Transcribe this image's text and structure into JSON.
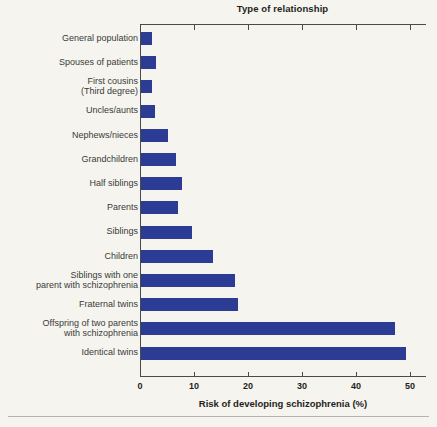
{
  "chart_data": {
    "type": "bar",
    "orientation": "horizontal",
    "title": "Type of relationship",
    "xlabel": "Risk of developing schizophrenia (%)",
    "ylabel": "",
    "xlim": [
      0,
      50
    ],
    "xticks": [
      0,
      10,
      20,
      30,
      40,
      50
    ],
    "xtick_labels": [
      "0",
      "10",
      "20",
      "30",
      "40",
      "50"
    ],
    "grid": false,
    "legend": null,
    "bar_color": "#2c3c94",
    "background_color": "#f6f4ef",
    "categories": [
      "General population",
      "Spouses of patients",
      "First cousins\n(Third degree)",
      "Uncles/aunts",
      "Nephews/nieces",
      "Grandchildren",
      "Half siblings",
      "Parents",
      "Siblings",
      "Children",
      "Siblings with one\nparent with schizophrenia",
      "Fraternal twins",
      "Offspring of two parents\nwith schizophrenia",
      "Identical twins"
    ],
    "values": [
      2,
      2.8,
      2,
      2.5,
      5,
      6.5,
      7.6,
      6.8,
      9.4,
      13.3,
      17.4,
      18,
      47,
      49
    ]
  },
  "footer": {
    "rule": ""
  }
}
